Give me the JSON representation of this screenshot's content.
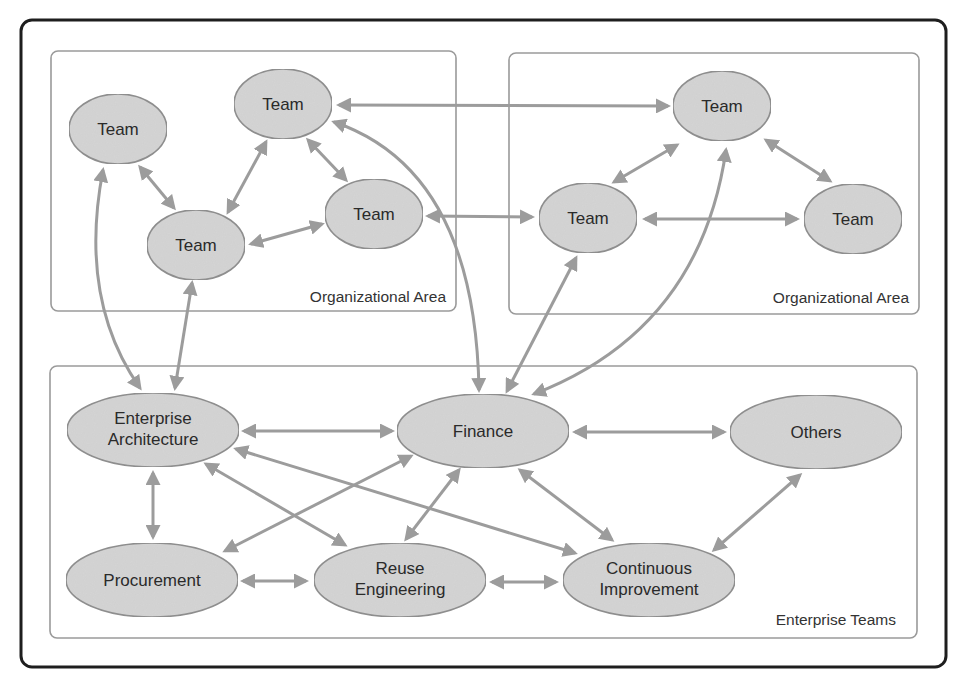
{
  "diagram": {
    "areas": [
      {
        "id": "org-area-left",
        "label": "Organizational Area"
      },
      {
        "id": "org-area-right",
        "label": "Organizational Area"
      },
      {
        "id": "enterprise-teams",
        "label": "Enterprise Teams"
      }
    ],
    "nodes": {
      "team_l1": {
        "label": "Team"
      },
      "team_l2": {
        "label": "Team"
      },
      "team_l3": {
        "label": "Team"
      },
      "team_l4": {
        "label": "Team"
      },
      "team_r1": {
        "label": "Team"
      },
      "team_r2": {
        "label": "Team"
      },
      "team_r3": {
        "label": "Team"
      },
      "enterprise_architecture": {
        "line1": "Enterprise",
        "line2": "Architecture"
      },
      "finance": {
        "label": "Finance"
      },
      "others": {
        "label": "Others"
      },
      "procurement": {
        "label": "Procurement"
      },
      "reuse_engineering": {
        "line1": "Reuse",
        "line2": "Engineering"
      },
      "continuous_improvement": {
        "line1": "Continuous",
        "line2": "Improvement"
      }
    },
    "edges": [
      [
        "team_l1",
        "team_l3"
      ],
      [
        "team_l3",
        "team_l2"
      ],
      [
        "team_l2",
        "team_l4"
      ],
      [
        "team_l3",
        "team_l4"
      ],
      [
        "team_l2",
        "team_r1"
      ],
      [
        "team_l4",
        "team_r2"
      ],
      [
        "team_r1",
        "team_r2"
      ],
      [
        "team_r1",
        "team_r3"
      ],
      [
        "team_r2",
        "team_r3"
      ],
      [
        "team_l1",
        "enterprise_architecture"
      ],
      [
        "team_l3",
        "enterprise_architecture"
      ],
      [
        "team_l2",
        "finance"
      ],
      [
        "team_r2",
        "finance"
      ],
      [
        "team_r1",
        "finance"
      ],
      [
        "enterprise_architecture",
        "finance"
      ],
      [
        "finance",
        "others"
      ],
      [
        "enterprise_architecture",
        "procurement"
      ],
      [
        "enterprise_architecture",
        "reuse_engineering"
      ],
      [
        "enterprise_architecture",
        "continuous_improvement"
      ],
      [
        "finance",
        "procurement"
      ],
      [
        "finance",
        "reuse_engineering"
      ],
      [
        "finance",
        "continuous_improvement"
      ],
      [
        "others",
        "continuous_improvement"
      ],
      [
        "procurement",
        "reuse_engineering"
      ],
      [
        "reuse_engineering",
        "continuous_improvement"
      ]
    ],
    "colors": {
      "node_fill": "#d4d4d4",
      "node_stroke": "#8f8f8f",
      "edge": "#9c9c9c",
      "frame": "#1e1e1e",
      "area_border": "#9a9a9a"
    }
  }
}
